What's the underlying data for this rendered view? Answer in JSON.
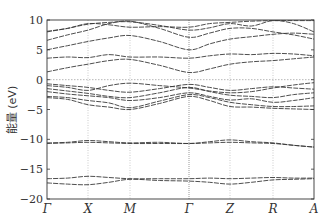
{
  "chart_data": {
    "type": "line",
    "title": "",
    "xlabel": "",
    "ylabel": "能量 (eV)",
    "ylim": [
      -20,
      10
    ],
    "yticks": [
      10,
      5,
      0,
      -5,
      -10,
      -15,
      -20
    ],
    "kpoints": [
      "Γ",
      "X",
      "M",
      "Γ",
      "Z",
      "R",
      "A"
    ],
    "fermi_level": 0,
    "grid": "vertical dotted lines at high-symmetry points",
    "x": [
      0,
      0.5,
      1,
      1.5,
      2,
      2.5,
      3,
      3.5,
      4,
      4.5,
      5,
      5.5,
      6
    ],
    "series": [
      {
        "name": "band1",
        "values": [
          -16.6,
          -16.5,
          -16.2,
          -16.4,
          -16.6,
          -16.6,
          -16.6,
          -16.5,
          -16.6,
          -16.5,
          -16.4,
          -16.5,
          -16.5
        ]
      },
      {
        "name": "band2",
        "values": [
          -17.3,
          -17.5,
          -17.6,
          -17.2,
          -16.7,
          -16.9,
          -17.0,
          -17.2,
          -17.5,
          -17.2,
          -16.8,
          -16.7,
          -16.6
        ]
      },
      {
        "name": "band3",
        "values": [
          -10.6,
          -10.5,
          -10.2,
          -10.4,
          -10.6,
          -10.5,
          -10.7,
          -10.4,
          -10.1,
          -10.4,
          -10.6,
          -11.0,
          -11.3
        ]
      },
      {
        "name": "band4",
        "values": [
          -10.7,
          -10.6,
          -10.5,
          -10.6,
          -10.7,
          -10.7,
          -10.7,
          -10.6,
          -10.5,
          -10.6,
          -10.7,
          -11.0,
          -11.3
        ]
      },
      {
        "name": "band5",
        "values": [
          -3.0,
          -3.3,
          -4.2,
          -4.6,
          -5.0,
          -4.0,
          -2.8,
          -3.5,
          -4.5,
          -4.6,
          -4.8,
          -4.9,
          -5.0
        ]
      },
      {
        "name": "band6",
        "values": [
          -2.8,
          -3.0,
          -3.5,
          -3.9,
          -4.7,
          -3.6,
          -2.5,
          -3.0,
          -3.8,
          -4.2,
          -4.5,
          -4.5,
          -4.4
        ]
      },
      {
        "name": "band7",
        "values": [
          -2.0,
          -2.4,
          -2.7,
          -3.0,
          -3.5,
          -3.0,
          -2.2,
          -2.8,
          -3.4,
          -3.2,
          -3.8,
          -3.5,
          -3.0
        ]
      },
      {
        "name": "band8",
        "values": [
          -1.5,
          -1.9,
          -2.3,
          -2.8,
          -3.0,
          -2.2,
          -1.3,
          -2.0,
          -2.6,
          -2.8,
          -3.0,
          -2.5,
          -2.2
        ]
      },
      {
        "name": "band9",
        "values": [
          -1.0,
          -1.3,
          -1.8,
          -1.0,
          -0.6,
          -1.0,
          -1.4,
          -1.9,
          -2.2,
          -2.0,
          -1.4,
          -0.9,
          -0.5
        ]
      },
      {
        "name": "band10",
        "values": [
          -0.7,
          -1.0,
          -1.3,
          -1.8,
          -2.1,
          -1.5,
          -0.8,
          -1.3,
          -1.8,
          -1.5,
          -1.2,
          -1.4,
          -1.6
        ]
      },
      {
        "name": "band11",
        "values": [
          1.3,
          2.0,
          2.6,
          3.2,
          3.4,
          2.4,
          1.2,
          1.8,
          2.6,
          3.0,
          3.2,
          3.5,
          3.8
        ]
      },
      {
        "name": "band12",
        "values": [
          3.6,
          3.8,
          3.7,
          4.2,
          3.8,
          3.8,
          3.6,
          4.0,
          4.3,
          4.2,
          4.4,
          4.3,
          4.0
        ]
      },
      {
        "name": "band13",
        "values": [
          5.0,
          5.7,
          6.4,
          7.0,
          7.4,
          6.4,
          5.0,
          6.0,
          6.8,
          7.2,
          7.6,
          7.8,
          7.6
        ]
      },
      {
        "name": "band14",
        "values": [
          6.6,
          7.5,
          8.3,
          9.4,
          9.8,
          8.6,
          7.1,
          7.8,
          8.6,
          8.6,
          8.0,
          7.5,
          6.8
        ]
      },
      {
        "name": "band15",
        "values": [
          8.0,
          8.6,
          9.3,
          9.6,
          9.7,
          9.1,
          8.3,
          8.7,
          9.4,
          9.0,
          9.9,
          9.4,
          8.0
        ]
      },
      {
        "name": "band16",
        "values": [
          8.1,
          8.6,
          9.4,
          9.2,
          8.8,
          8.9,
          8.8,
          9.4,
          9.6,
          9.8,
          9.9,
          9.9,
          9.9
        ]
      }
    ]
  }
}
